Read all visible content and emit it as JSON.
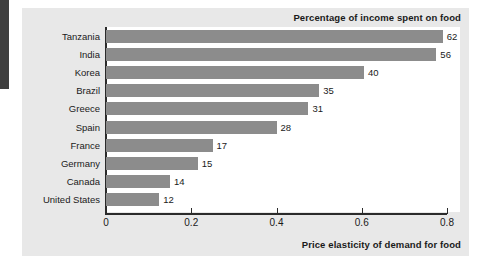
{
  "chart_data": {
    "type": "bar",
    "orientation": "horizontal",
    "title": "Percentage of income spent on food",
    "xlabel": "Price elasticity of demand for food",
    "ylabel": "",
    "categories": [
      "Tanzania",
      "India",
      "Korea",
      "Brazil",
      "Greece",
      "Spain",
      "France",
      "Germany",
      "Canada",
      "United States"
    ],
    "values": [
      0.79,
      0.775,
      0.605,
      0.5,
      0.475,
      0.4,
      0.25,
      0.215,
      0.15,
      0.125
    ],
    "data_labels": [
      "62",
      "56",
      "40",
      "35",
      "31",
      "28",
      "17",
      "15",
      "14",
      "12"
    ],
    "series": [
      {
        "name": "Price elasticity of demand for food",
        "values": [
          0.79,
          0.775,
          0.605,
          0.5,
          0.475,
          0.4,
          0.25,
          0.215,
          0.15,
          0.125
        ]
      },
      {
        "name": "Percentage of income spent on food",
        "values": [
          62,
          56,
          40,
          35,
          31,
          28,
          17,
          15,
          14,
          12
        ]
      }
    ],
    "xlim": [
      0,
      0.8
    ],
    "xticks": [
      0,
      0.2,
      0.4,
      0.6,
      0.8
    ],
    "xtick_labels": [
      "0",
      "0.2",
      "0.4",
      "0.6",
      "0.8"
    ],
    "grid": false,
    "legend": "none",
    "bar_color": "#8c8c8c",
    "panel_color": "#e8e8e8",
    "plot_color": "#ffffff",
    "axis_color": "#2b2b2b"
  }
}
